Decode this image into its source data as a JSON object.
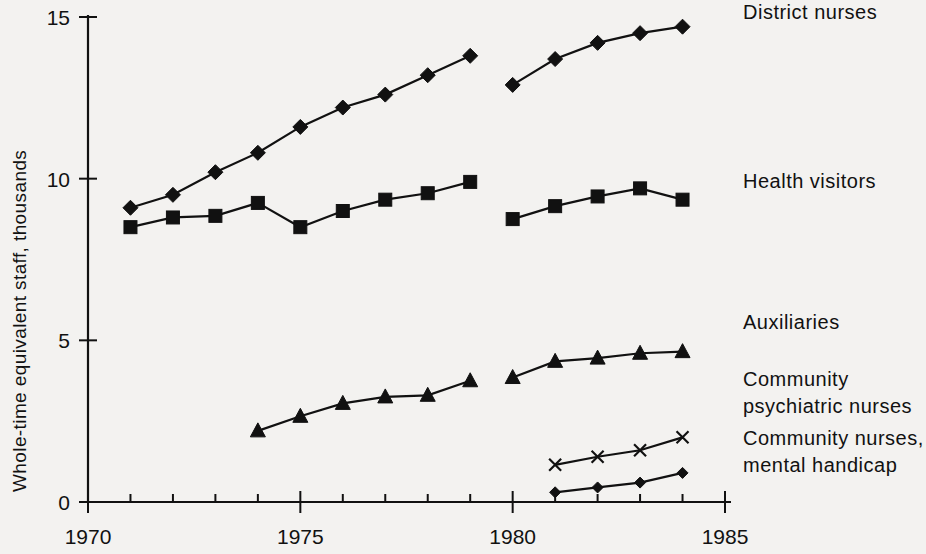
{
  "chart_data": {
    "type": "line",
    "title": "",
    "xlabel": "",
    "ylabel": "Whole-time equivalent staff, thousands",
    "xlim": [
      1970,
      1985.6
    ],
    "ylim": [
      0,
      15
    ],
    "x_ticks_major": [
      1970,
      1975,
      1980,
      1985
    ],
    "x_tick_labels": [
      "1970",
      "1975",
      "1980",
      "1985"
    ],
    "x_ticks_minor": [
      1971,
      1972,
      1973,
      1974,
      1976,
      1977,
      1978,
      1979,
      1981,
      1982,
      1983,
      1984
    ],
    "y_ticks": [
      0,
      5,
      10,
      15
    ],
    "y_tick_labels": [
      "0",
      "5",
      "10",
      "15"
    ],
    "grid": false,
    "legend": "right-inline-labels",
    "series": [
      {
        "name": "District nurses",
        "marker": "diamond",
        "label": "District nurses",
        "label_x": 1985.0,
        "label_y": 14.95,
        "segments": [
          {
            "x": [
              1971,
              1972,
              1973,
              1974,
              1975,
              1976,
              1977,
              1978,
              1979
            ],
            "values": [
              9.1,
              9.5,
              10.2,
              10.8,
              11.6,
              12.2,
              12.6,
              13.2,
              13.8
            ]
          },
          {
            "x": [
              1980,
              1981,
              1982,
              1983,
              1984
            ],
            "values": [
              12.9,
              13.7,
              14.2,
              14.5,
              14.7
            ]
          }
        ]
      },
      {
        "name": "Health visitors",
        "marker": "square",
        "label": "Health visitors",
        "label_x": 1985.0,
        "label_y": 9.7,
        "segments": [
          {
            "x": [
              1971,
              1972,
              1973,
              1974,
              1975,
              1976,
              1977,
              1978,
              1979
            ],
            "values": [
              8.5,
              8.8,
              8.85,
              9.25,
              8.5,
              9.0,
              9.35,
              9.55,
              9.9
            ]
          },
          {
            "x": [
              1980,
              1981,
              1982,
              1983,
              1984
            ],
            "values": [
              8.75,
              9.15,
              9.45,
              9.7,
              9.35
            ]
          }
        ]
      },
      {
        "name": "Auxiliaries",
        "marker": "triangle",
        "label": "Auxiliaries",
        "label_x": 1985.0,
        "label_y": 5.35,
        "segments": [
          {
            "x": [
              1974,
              1975,
              1976,
              1977,
              1978,
              1979
            ],
            "values": [
              2.2,
              2.65,
              3.05,
              3.25,
              3.3,
              3.75
            ]
          },
          {
            "x": [
              1980,
              1981,
              1982,
              1983,
              1984
            ],
            "values": [
              3.85,
              4.35,
              4.45,
              4.6,
              4.65
            ]
          }
        ]
      },
      {
        "name": "Community psychiatric nurses",
        "marker": "cross",
        "label": "Community\npsychiatric nurses",
        "label_line1": "Community",
        "label_line2": "psychiatric nurses",
        "label_x": 1985.0,
        "label_y": 3.6,
        "segments": [
          {
            "x": [
              1981,
              1982,
              1983,
              1984
            ],
            "values": [
              1.15,
              1.4,
              1.6,
              2.0
            ]
          }
        ]
      },
      {
        "name": "Community nurses, mental handicap",
        "marker": "small-diamond",
        "label": "Community nurses,\nmental handicap",
        "label_line1": "Community nurses,",
        "label_line2": "mental handicap",
        "label_x": 1985.0,
        "label_y": 1.75,
        "segments": [
          {
            "x": [
              1981,
              1982,
              1983,
              1984
            ],
            "values": [
              0.3,
              0.45,
              0.6,
              0.9
            ]
          }
        ]
      }
    ],
    "colors": {
      "ink": "#111111",
      "background": "#f3f2f0"
    }
  },
  "axis": {
    "y_title": "Whole-time equivalent staff, thousands"
  }
}
